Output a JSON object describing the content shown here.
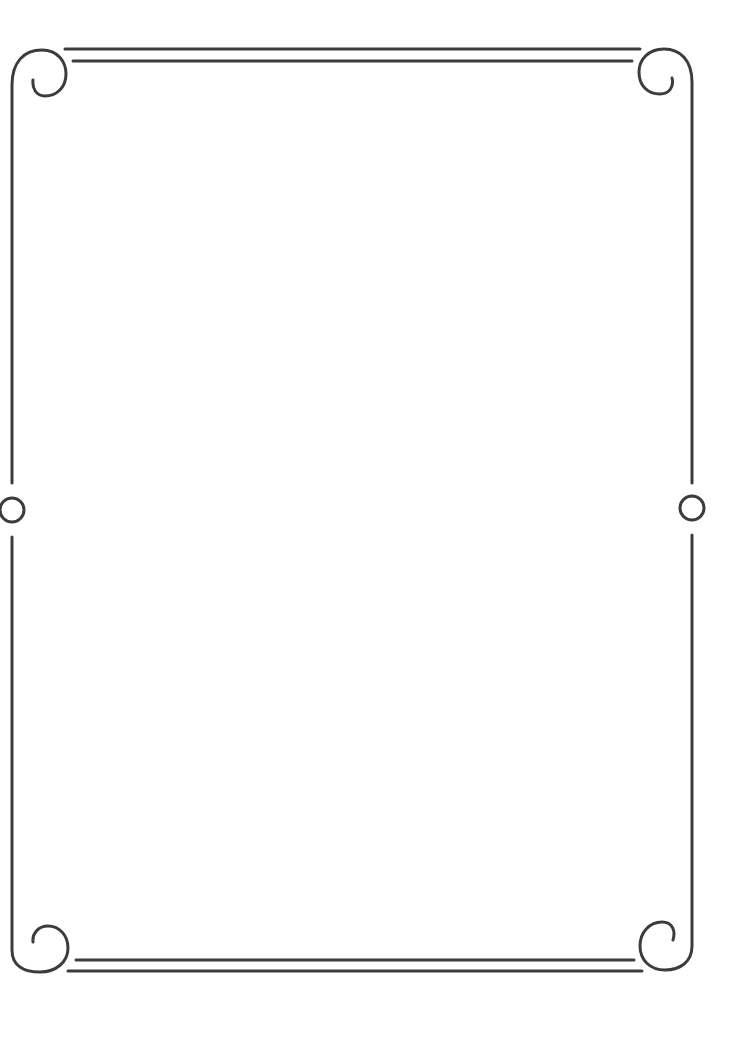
{
  "page": {
    "background": "#ffffff"
  },
  "frame": {
    "stroke_color": "#3c3c3c",
    "stroke_width": 3,
    "elements": [
      "top-double-rule",
      "bottom-double-rule",
      "left-border-line",
      "right-border-line",
      "top-left-scroll",
      "top-right-scroll",
      "bottom-left-scroll",
      "bottom-right-scroll",
      "left-mid-ring",
      "right-mid-ring"
    ]
  }
}
